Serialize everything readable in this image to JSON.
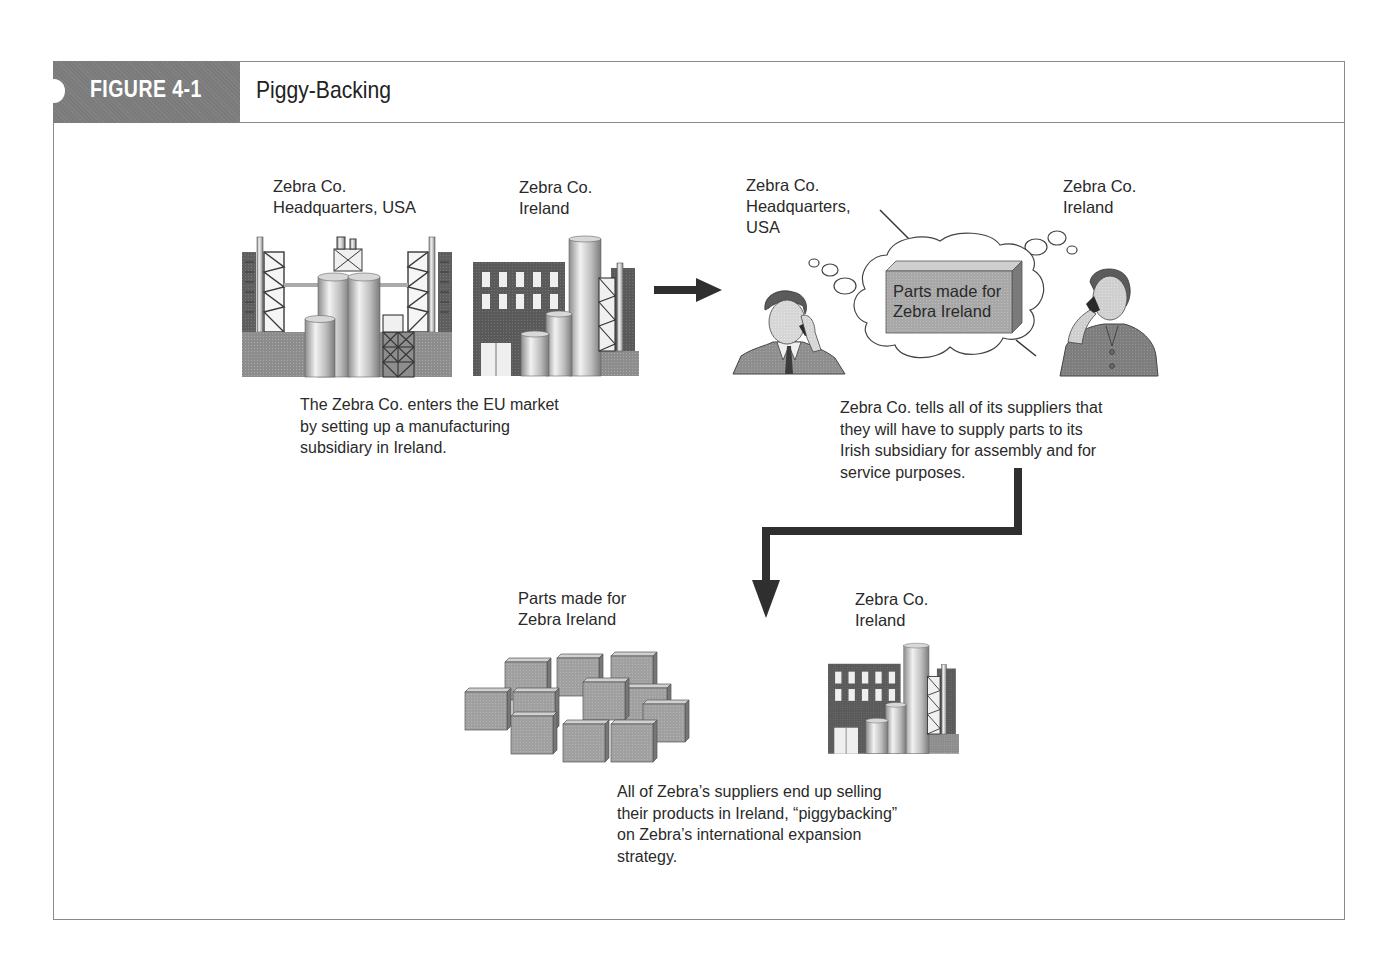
{
  "figure": {
    "number_label": "FIGURE 4-1",
    "title": "Piggy-Backing"
  },
  "panel_1": {
    "hq_label": "Zebra Co.\nHeadquarters, USA",
    "ireland_label": "Zebra Co.\nIreland",
    "caption": "The Zebra Co. enters the EU market\nby setting up a manufacturing\nsubsidiary in Ireland."
  },
  "panel_2": {
    "hq_label": "Zebra Co.\nHeadquarters,\nUSA",
    "ireland_label": "Zebra Co.\nIreland",
    "box_label": "Parts made for\nZebra Ireland",
    "caption": "Zebra Co. tells all of its suppliers that\nthey will have to supply parts to its\nIrish subsidiary for assembly and for\nservice purposes."
  },
  "panel_3": {
    "parts_label": "Parts made for\nZebra Ireland",
    "ireland_label": "Zebra Co.\nIreland",
    "caption": "All of Zebra’s suppliers end up selling\ntheir products in Ireland, “piggybacking”\non Zebra’s international expansion\nstrategy."
  },
  "icons": {
    "hq_factory": "factory-complex-icon",
    "ireland_factory": "factory-building-icon",
    "man_phone": "businessman-on-phone-icon",
    "woman_phone": "businesswoman-on-phone-icon",
    "thought_cloud": "thought-cloud-icon",
    "parts_box": "box-icon",
    "parts_pile": "stacked-boxes-icon",
    "arrow_right": "arrow-right-icon",
    "arrow_elbow_down": "elbow-arrow-down-icon"
  },
  "colors": {
    "tab_bg": "#7b7b7b",
    "frame_border": "#8a8a8a",
    "dark_gray": "#5e5e5e",
    "mid_gray": "#9a9a9a",
    "light_gray": "#c8c8c8",
    "text": "#2a2a2a"
  }
}
